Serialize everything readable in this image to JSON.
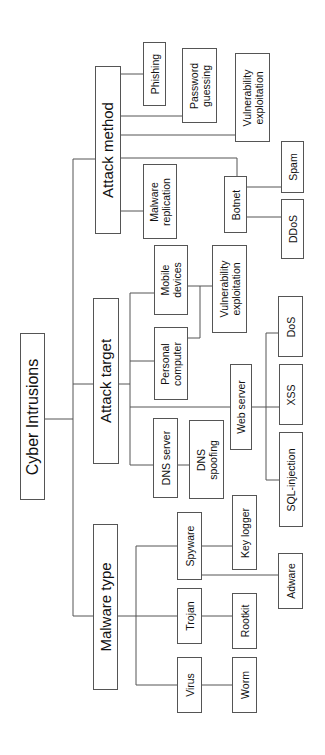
{
  "diagram": {
    "root": {
      "label": "Cyber Intrusions"
    },
    "categories": {
      "attack_method": {
        "label": "Attack method",
        "children": {
          "phishing": "Phishing",
          "password_guessing": "Password\nguessing",
          "vulnerability_exploitation": "Vulnerability\nexploitation",
          "malware_replication": "Malware\nreplication",
          "botnet": "Botnet",
          "spam": "Spam",
          "ddos": "DDoS"
        }
      },
      "attack_target": {
        "label": "Attack target",
        "children": {
          "mobile_devices": "Mobile\ndevices",
          "personal_computer": "Personal\ncomputer",
          "vulnerability_exploitation": "Vulnerability\nexploitation",
          "dns_server": "DNS server",
          "dns_spoofing": "DNS\nspoofing",
          "web_server": "Web server",
          "dos": "DoS",
          "xss": "XSS",
          "sql_injection": "SQL-injection"
        }
      },
      "malware_type": {
        "label": "Malware type",
        "children": {
          "virus": "Virus",
          "worm": "Worm",
          "trojan": "Trojan",
          "rootkit": "Rootkit",
          "spyware": "Spyware",
          "key_logger": "Key logger",
          "adware": "Adware"
        }
      }
    },
    "colors": {
      "line": "#555555",
      "text": "#111111",
      "background": "#ffffff"
    }
  }
}
